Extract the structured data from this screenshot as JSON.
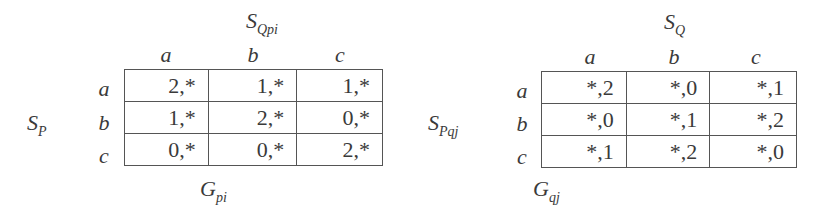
{
  "games": [
    {
      "id": "Gpi",
      "col_player": {
        "base": "S",
        "sub": "Qpi"
      },
      "row_player": {
        "base": "S",
        "sub": "P"
      },
      "game_label": {
        "base": "G",
        "sub": "pi"
      },
      "col_labels": [
        "a",
        "b",
        "c"
      ],
      "row_labels": [
        "a",
        "b",
        "c"
      ],
      "cells": [
        [
          "2,*",
          "1,*",
          "1,*"
        ],
        [
          "1,*",
          "2,*",
          "0,*"
        ],
        [
          "0,*",
          "0,*",
          "2,*"
        ]
      ]
    },
    {
      "id": "Gqj",
      "col_player": {
        "base": "S",
        "sub": "Q"
      },
      "row_player": {
        "base": "S",
        "sub": "Pqj"
      },
      "game_label": {
        "base": "G",
        "sub": "qj"
      },
      "col_labels": [
        "a",
        "b",
        "c"
      ],
      "row_labels": [
        "a",
        "b",
        "c"
      ],
      "cells": [
        [
          "*,2",
          "*,0",
          "*,1"
        ],
        [
          "*,0",
          "*,1",
          "*,2"
        ],
        [
          "*,1",
          "*,2",
          "*,0"
        ]
      ]
    }
  ]
}
